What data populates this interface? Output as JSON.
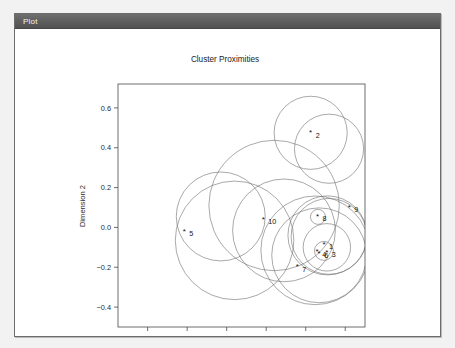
{
  "window": {
    "titlebar_label": "Plot"
  },
  "chart_data": {
    "type": "scatter",
    "title": "Cluster Proximities",
    "xlabel": "",
    "ylabel": "Dimension 2",
    "xlim": [
      -0.95,
      0.3
    ],
    "ylim": [
      -0.5,
      0.72
    ],
    "grid": false,
    "legend": null,
    "xticks": [
      -0.8,
      -0.6,
      -0.4,
      -0.2,
      0.0,
      0.2
    ],
    "xtick_labels": [
      "-0.8",
      "-0.6",
      "-0.4",
      "-0.2",
      "0.0",
      "0.2"
    ],
    "yticks": [
      0.6,
      0.4,
      0.2,
      0.0,
      -0.2,
      -0.4
    ],
    "ytick_labels": [
      "0.6",
      "0.4",
      "0.2",
      "0.0",
      "-0.2",
      "-0.4"
    ],
    "marker": "*",
    "points": [
      {
        "label": "1",
        "x": 0.093,
        "y": -0.085
      },
      {
        "label": "2",
        "x": 0.025,
        "y": 0.475
      },
      {
        "label": "3",
        "x": 0.107,
        "y": -0.125
      },
      {
        "label": "4",
        "x": 0.058,
        "y": -0.123
      },
      {
        "label": "5",
        "x": -0.615,
        "y": -0.02
      },
      {
        "label": "6",
        "x": 0.068,
        "y": -0.13
      },
      {
        "label": "7",
        "x": -0.043,
        "y": -0.2
      },
      {
        "label": "8",
        "x": 0.06,
        "y": 0.055
      },
      {
        "label": "9",
        "x": 0.22,
        "y": 0.1
      },
      {
        "label": "10",
        "x": -0.215,
        "y": 0.04
      }
    ],
    "circles": [
      {
        "center_label": "2",
        "cx": 0.025,
        "cy": 0.475,
        "r": 0.185
      },
      {
        "center_label": "2b",
        "cx": 0.118,
        "cy": 0.395,
        "r": 0.175
      },
      {
        "center_label": "5",
        "cx": -0.43,
        "cy": 0.055,
        "r": 0.225
      },
      {
        "center_label": "5b",
        "cx": -0.36,
        "cy": -0.065,
        "r": 0.3
      },
      {
        "center_label": "10",
        "cx": -0.16,
        "cy": 0.11,
        "r": 0.33
      },
      {
        "center_label": "10b",
        "cx": -0.11,
        "cy": -0.015,
        "r": 0.26
      },
      {
        "center_label": "7",
        "cx": 0.048,
        "cy": -0.115,
        "r": 0.275
      },
      {
        "center_label": "7b",
        "cx": 0.068,
        "cy": -0.14,
        "r": 0.24
      },
      {
        "center_label": "9",
        "cx": 0.11,
        "cy": -0.04,
        "r": 0.2
      },
      {
        "center_label": "9b",
        "cx": 0.118,
        "cy": -0.045,
        "r": 0.192
      },
      {
        "center_label": "1",
        "cx": 0.107,
        "cy": -0.1,
        "r": 0.12
      },
      {
        "center_label": "8",
        "cx": 0.062,
        "cy": 0.053,
        "r": 0.038
      },
      {
        "center_label": "3",
        "cx": 0.092,
        "cy": -0.118,
        "r": 0.048
      }
    ]
  }
}
